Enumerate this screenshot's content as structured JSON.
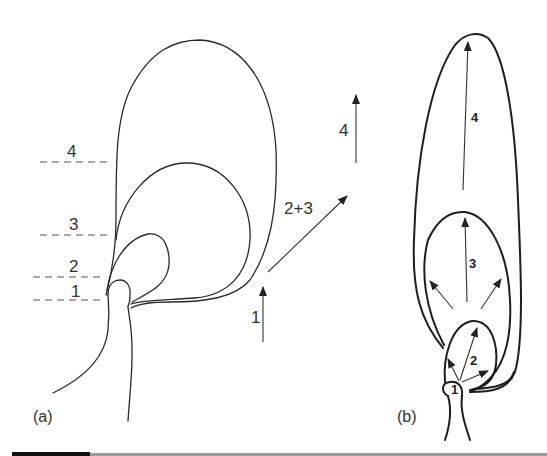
{
  "figure": {
    "panel_a": {
      "label": "(a)",
      "level_labels": [
        "1",
        "2",
        "3",
        "4"
      ],
      "arrow_labels": {
        "first": "1",
        "second": "2+3",
        "third": "4"
      }
    },
    "panel_b": {
      "label": "(b)",
      "region_labels": [
        "1",
        "2",
        "3",
        "4"
      ]
    }
  },
  "colors": {
    "line": "#2a2a2a",
    "background": "#ffffff",
    "bottom_bar": "#9a9a9a",
    "bottom_bar_dark": "#111111"
  }
}
